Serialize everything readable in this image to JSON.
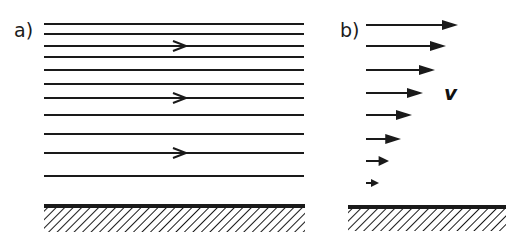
{
  "figure": {
    "panel_a": {
      "label": "a)",
      "description": "Uniform flow: parallel streamlines above a wall",
      "streamlines_y": [
        24,
        34,
        46,
        57,
        70,
        84,
        98,
        115,
        134,
        153,
        176
      ],
      "streamline_x_range": [
        44,
        304
      ],
      "arrow_on_streamlines_y": [
        46,
        98,
        153
      ],
      "arrow_x": 186,
      "wall": {
        "y": 206,
        "x_range": [
          44,
          305
        ],
        "hatch_bottom": 232
      }
    },
    "panel_b": {
      "label": "b)",
      "velocity_symbol": "v",
      "description": "Velocity profile: arrow length decreases toward the wall",
      "arrow_start_x": 366,
      "arrows": [
        {
          "y": 25,
          "end_x": 458
        },
        {
          "y": 46,
          "end_x": 446
        },
        {
          "y": 70,
          "end_x": 435
        },
        {
          "y": 93,
          "end_x": 423
        },
        {
          "y": 115,
          "end_x": 412
        },
        {
          "y": 139,
          "end_x": 401
        },
        {
          "y": 161,
          "end_x": 389
        },
        {
          "y": 183,
          "end_x": 379
        }
      ],
      "wall": {
        "y": 207,
        "x_range": [
          348,
          506
        ],
        "hatch_bottom": 231
      }
    }
  },
  "colors": {
    "ink": "#1a1a1a",
    "background": "#ffffff"
  }
}
